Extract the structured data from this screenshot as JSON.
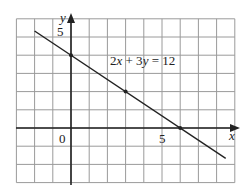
{
  "chart_data": {
    "type": "line",
    "title": "",
    "xlabel": "x",
    "ylabel": "y",
    "xlim": [
      -3,
      9
    ],
    "ylim": [
      -3,
      6
    ],
    "grid": true,
    "x_tick_labels": [
      {
        "value": 5,
        "label": "5"
      }
    ],
    "y_tick_labels": [
      {
        "value": 5,
        "label": "5"
      }
    ],
    "origin_label": "0",
    "series": [
      {
        "name": "2x + 3y = 12",
        "equation": "2x + 3y = 12",
        "line_from": [
          -2,
          5.33
        ],
        "line_to": [
          8.5,
          -1.67
        ],
        "marked_points": [
          [
            0,
            4
          ],
          [
            3,
            2
          ],
          [
            6,
            0
          ]
        ]
      }
    ],
    "annotations": [
      {
        "text": "2x + 3y = 12",
        "x": 3.7,
        "y": 3.7
      }
    ]
  },
  "labels": {
    "equation_parts": [
      "2",
      "x",
      " + 3",
      "y",
      " = 12"
    ],
    "x_axis": "x",
    "y_axis": "y",
    "x_tick": "5",
    "y_tick": "5",
    "origin": "0"
  }
}
